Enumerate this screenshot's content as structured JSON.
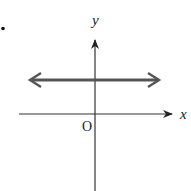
{
  "diagram": {
    "type": "coordinate-graph",
    "bullet": "•",
    "axes": {
      "x_label": "x",
      "y_label": "y",
      "origin_label": "O"
    },
    "line": {
      "kind": "horizontal",
      "position": "above x-axis",
      "arrows": "both ends"
    },
    "colors": {
      "axis": "#222222",
      "line": "#555555",
      "background": "#ffffff"
    }
  }
}
